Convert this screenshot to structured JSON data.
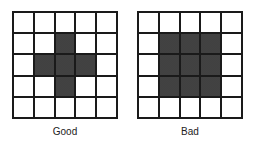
{
  "diagram": {
    "grid_size": 5,
    "fill_color": "#555555",
    "line_color": "#1a1a1a",
    "panels": [
      {
        "id": "good",
        "label": "Good",
        "filled": [
          [
            1,
            2
          ],
          [
            2,
            1
          ],
          [
            2,
            2
          ],
          [
            2,
            3
          ],
          [
            3,
            2
          ]
        ]
      },
      {
        "id": "bad",
        "label": "Bad",
        "filled": [
          [
            1,
            1
          ],
          [
            1,
            2
          ],
          [
            1,
            3
          ],
          [
            2,
            1
          ],
          [
            2,
            2
          ],
          [
            2,
            3
          ],
          [
            3,
            1
          ],
          [
            3,
            2
          ],
          [
            3,
            3
          ]
        ]
      }
    ]
  }
}
